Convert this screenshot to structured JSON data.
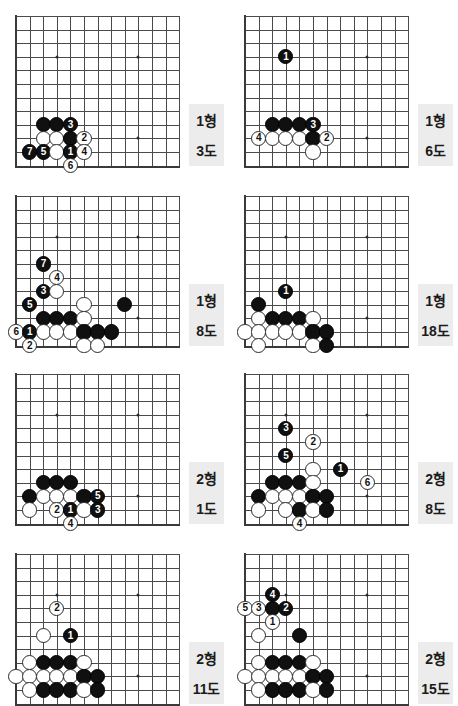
{
  "page": {
    "width": 458,
    "height": 700,
    "background": "#ffffff",
    "colors": {
      "grid_line": "#4a4a4a",
      "board_edge": "#3a3a3a",
      "black_stone": "#101010",
      "white_stone": "#ffffff",
      "caption_background": "#ececec",
      "caption_text": "#1b1b1b"
    }
  },
  "legend": {
    "hyeong_suffix": "형",
    "do_suffix": "도",
    "black_move_color": "#ffffff",
    "white_move_color": "#101010"
  },
  "diagrams": [
    {
      "id": "diagram-1",
      "problem_label": "1형",
      "figure_label": "3도",
      "cols": 12,
      "rows": 11,
      "stars": [
        [
          3,
          3
        ],
        [
          9,
          3
        ],
        [
          9,
          9
        ]
      ],
      "stones": [
        {
          "color": "black",
          "col": 2,
          "row": 8,
          "num": ""
        },
        {
          "color": "black",
          "col": 3,
          "row": 8,
          "num": ""
        },
        {
          "color": "black",
          "col": 4,
          "row": 8,
          "num": "3"
        },
        {
          "color": "white",
          "col": 2,
          "row": 9,
          "num": ""
        },
        {
          "color": "white",
          "col": 3,
          "row": 9,
          "num": ""
        },
        {
          "color": "black",
          "col": 4,
          "row": 9,
          "num": ""
        },
        {
          "color": "white",
          "col": 5,
          "row": 9,
          "num": "2"
        },
        {
          "color": "black",
          "col": 1,
          "row": 10,
          "num": "7"
        },
        {
          "color": "black",
          "col": 2,
          "row": 10,
          "num": "5"
        },
        {
          "color": "white",
          "col": 3,
          "row": 10,
          "num": ""
        },
        {
          "color": "black",
          "col": 4,
          "row": 10,
          "num": "1"
        },
        {
          "color": "white",
          "col": 5,
          "row": 10,
          "num": "4"
        },
        {
          "color": "white",
          "col": 4,
          "row": 11,
          "num": "6"
        }
      ]
    },
    {
      "id": "diagram-2",
      "problem_label": "1형",
      "figure_label": "6도",
      "cols": 12,
      "rows": 11,
      "stars": [
        [
          3,
          3
        ],
        [
          9,
          3
        ],
        [
          9,
          9
        ]
      ],
      "stones": [
        {
          "color": "black",
          "col": 3,
          "row": 3,
          "num": "1"
        },
        {
          "color": "black",
          "col": 2,
          "row": 8,
          "num": ""
        },
        {
          "color": "black",
          "col": 3,
          "row": 8,
          "num": ""
        },
        {
          "color": "black",
          "col": 4,
          "row": 8,
          "num": ""
        },
        {
          "color": "black",
          "col": 5,
          "row": 8,
          "num": "3"
        },
        {
          "color": "white",
          "col": 1,
          "row": 9,
          "num": "4"
        },
        {
          "color": "white",
          "col": 2,
          "row": 9,
          "num": ""
        },
        {
          "color": "white",
          "col": 3,
          "row": 9,
          "num": ""
        },
        {
          "color": "white",
          "col": 4,
          "row": 9,
          "num": ""
        },
        {
          "color": "black",
          "col": 5,
          "row": 9,
          "num": ""
        },
        {
          "color": "white",
          "col": 6,
          "row": 9,
          "num": "2"
        },
        {
          "color": "white",
          "col": 5,
          "row": 10,
          "num": ""
        }
      ]
    },
    {
      "id": "diagram-3",
      "problem_label": "1형",
      "figure_label": "8도",
      "cols": 12,
      "rows": 11,
      "stars": [
        [
          3,
          3
        ],
        [
          9,
          3
        ],
        [
          9,
          9
        ]
      ],
      "stones": [
        {
          "color": "black",
          "col": 2,
          "row": 5,
          "num": "7"
        },
        {
          "color": "white",
          "col": 3,
          "row": 6,
          "num": "4"
        },
        {
          "color": "black",
          "col": 2,
          "row": 7,
          "num": "3"
        },
        {
          "color": "white",
          "col": 3,
          "row": 7,
          "num": ""
        },
        {
          "color": "black",
          "col": 1,
          "row": 8,
          "num": "5"
        },
        {
          "color": "white",
          "col": 5,
          "row": 8,
          "num": ""
        },
        {
          "color": "black",
          "col": 8,
          "row": 8,
          "num": ""
        },
        {
          "color": "black",
          "col": 2,
          "row": 9,
          "num": ""
        },
        {
          "color": "black",
          "col": 3,
          "row": 9,
          "num": ""
        },
        {
          "color": "black",
          "col": 4,
          "row": 9,
          "num": ""
        },
        {
          "color": "white",
          "col": 5,
          "row": 9,
          "num": ""
        },
        {
          "color": "white",
          "col": 0,
          "row": 10,
          "num": "6"
        },
        {
          "color": "black",
          "col": 1,
          "row": 10,
          "num": "1"
        },
        {
          "color": "white",
          "col": 2,
          "row": 10,
          "num": ""
        },
        {
          "color": "white",
          "col": 3,
          "row": 10,
          "num": ""
        },
        {
          "color": "white",
          "col": 4,
          "row": 10,
          "num": ""
        },
        {
          "color": "black",
          "col": 5,
          "row": 10,
          "num": ""
        },
        {
          "color": "black",
          "col": 6,
          "row": 10,
          "num": ""
        },
        {
          "color": "black",
          "col": 7,
          "row": 10,
          "num": ""
        },
        {
          "color": "white",
          "col": 1,
          "row": 11,
          "num": "2"
        },
        {
          "color": "white",
          "col": 5,
          "row": 11,
          "num": ""
        },
        {
          "color": "white",
          "col": 6,
          "row": 11,
          "num": ""
        }
      ]
    },
    {
      "id": "diagram-4",
      "problem_label": "1형",
      "figure_label": "18도",
      "cols": 12,
      "rows": 11,
      "stars": [
        [
          3,
          3
        ],
        [
          9,
          3
        ],
        [
          9,
          9
        ]
      ],
      "stones": [
        {
          "color": "black",
          "col": 3,
          "row": 7,
          "num": "1"
        },
        {
          "color": "black",
          "col": 1,
          "row": 8,
          "num": ""
        },
        {
          "color": "white",
          "col": 1,
          "row": 9,
          "num": ""
        },
        {
          "color": "black",
          "col": 2,
          "row": 9,
          "num": ""
        },
        {
          "color": "black",
          "col": 3,
          "row": 9,
          "num": ""
        },
        {
          "color": "black",
          "col": 4,
          "row": 9,
          "num": ""
        },
        {
          "color": "white",
          "col": 5,
          "row": 9,
          "num": ""
        },
        {
          "color": "white",
          "col": 0,
          "row": 10,
          "num": ""
        },
        {
          "color": "white",
          "col": 1,
          "row": 10,
          "num": ""
        },
        {
          "color": "white",
          "col": 2,
          "row": 10,
          "num": ""
        },
        {
          "color": "white",
          "col": 3,
          "row": 10,
          "num": ""
        },
        {
          "color": "white",
          "col": 4,
          "row": 10,
          "num": ""
        },
        {
          "color": "black",
          "col": 5,
          "row": 10,
          "num": ""
        },
        {
          "color": "black",
          "col": 6,
          "row": 10,
          "num": ""
        },
        {
          "color": "white",
          "col": 1,
          "row": 11,
          "num": ""
        },
        {
          "color": "white",
          "col": 5,
          "row": 11,
          "num": ""
        },
        {
          "color": "black",
          "col": 6,
          "row": 11,
          "num": ""
        }
      ]
    },
    {
      "id": "diagram-5",
      "problem_label": "2형",
      "figure_label": "1도",
      "cols": 12,
      "rows": 11,
      "stars": [
        [
          3,
          3
        ],
        [
          9,
          3
        ],
        [
          9,
          9
        ]
      ],
      "stones": [
        {
          "color": "black",
          "col": 2,
          "row": 8,
          "num": ""
        },
        {
          "color": "black",
          "col": 3,
          "row": 8,
          "num": ""
        },
        {
          "color": "black",
          "col": 4,
          "row": 8,
          "num": ""
        },
        {
          "color": "black",
          "col": 1,
          "row": 9,
          "num": ""
        },
        {
          "color": "white",
          "col": 2,
          "row": 9,
          "num": ""
        },
        {
          "color": "white",
          "col": 3,
          "row": 9,
          "num": ""
        },
        {
          "color": "white",
          "col": 4,
          "row": 9,
          "num": ""
        },
        {
          "color": "black",
          "col": 5,
          "row": 9,
          "num": ""
        },
        {
          "color": "black",
          "col": 6,
          "row": 9,
          "num": "5"
        },
        {
          "color": "white",
          "col": 1,
          "row": 10,
          "num": ""
        },
        {
          "color": "white",
          "col": 3,
          "row": 10,
          "num": "2"
        },
        {
          "color": "black",
          "col": 4,
          "row": 10,
          "num": "1"
        },
        {
          "color": "white",
          "col": 5,
          "row": 10,
          "num": ""
        },
        {
          "color": "black",
          "col": 6,
          "row": 10,
          "num": "3"
        },
        {
          "color": "white",
          "col": 4,
          "row": 11,
          "num": "4"
        }
      ]
    },
    {
      "id": "diagram-6",
      "problem_label": "2형",
      "figure_label": "8도",
      "cols": 12,
      "rows": 11,
      "stars": [
        [
          3,
          3
        ],
        [
          9,
          3
        ],
        [
          9,
          9
        ]
      ],
      "stones": [
        {
          "color": "black",
          "col": 3,
          "row": 4,
          "num": "3"
        },
        {
          "color": "white",
          "col": 5,
          "row": 5,
          "num": "2"
        },
        {
          "color": "black",
          "col": 3,
          "row": 6,
          "num": "5"
        },
        {
          "color": "white",
          "col": 5,
          "row": 7,
          "num": ""
        },
        {
          "color": "black",
          "col": 7,
          "row": 7,
          "num": "1"
        },
        {
          "color": "black",
          "col": 2,
          "row": 8,
          "num": ""
        },
        {
          "color": "black",
          "col": 3,
          "row": 8,
          "num": ""
        },
        {
          "color": "black",
          "col": 4,
          "row": 8,
          "num": ""
        },
        {
          "color": "white",
          "col": 5,
          "row": 8,
          "num": ""
        },
        {
          "color": "white",
          "col": 9,
          "row": 8,
          "num": "6"
        },
        {
          "color": "black",
          "col": 1,
          "row": 9,
          "num": ""
        },
        {
          "color": "white",
          "col": 2,
          "row": 9,
          "num": ""
        },
        {
          "color": "white",
          "col": 3,
          "row": 9,
          "num": ""
        },
        {
          "color": "white",
          "col": 4,
          "row": 9,
          "num": ""
        },
        {
          "color": "black",
          "col": 5,
          "row": 9,
          "num": ""
        },
        {
          "color": "black",
          "col": 6,
          "row": 9,
          "num": ""
        },
        {
          "color": "white",
          "col": 1,
          "row": 10,
          "num": ""
        },
        {
          "color": "white",
          "col": 3,
          "row": 10,
          "num": ""
        },
        {
          "color": "black",
          "col": 4,
          "row": 10,
          "num": ""
        },
        {
          "color": "white",
          "col": 5,
          "row": 10,
          "num": ""
        },
        {
          "color": "black",
          "col": 6,
          "row": 10,
          "num": ""
        },
        {
          "color": "white",
          "col": 4,
          "row": 11,
          "num": "4"
        }
      ]
    },
    {
      "id": "diagram-7",
      "problem_label": "2형",
      "figure_label": "11도",
      "cols": 12,
      "rows": 11,
      "stars": [
        [
          3,
          3
        ],
        [
          9,
          3
        ],
        [
          9,
          9
        ]
      ],
      "stones": [
        {
          "color": "white",
          "col": 3,
          "row": 4,
          "num": "2"
        },
        {
          "color": "white",
          "col": 2,
          "row": 6,
          "num": ""
        },
        {
          "color": "black",
          "col": 4,
          "row": 6,
          "num": "1"
        },
        {
          "color": "white",
          "col": 1,
          "row": 8,
          "num": ""
        },
        {
          "color": "black",
          "col": 2,
          "row": 8,
          "num": ""
        },
        {
          "color": "black",
          "col": 3,
          "row": 8,
          "num": ""
        },
        {
          "color": "black",
          "col": 4,
          "row": 8,
          "num": ""
        },
        {
          "color": "white",
          "col": 5,
          "row": 8,
          "num": ""
        },
        {
          "color": "white",
          "col": 0,
          "row": 9,
          "num": ""
        },
        {
          "color": "white",
          "col": 1,
          "row": 9,
          "num": ""
        },
        {
          "color": "white",
          "col": 2,
          "row": 9,
          "num": ""
        },
        {
          "color": "white",
          "col": 3,
          "row": 9,
          "num": ""
        },
        {
          "color": "white",
          "col": 4,
          "row": 9,
          "num": ""
        },
        {
          "color": "black",
          "col": 5,
          "row": 9,
          "num": ""
        },
        {
          "color": "black",
          "col": 6,
          "row": 9,
          "num": ""
        },
        {
          "color": "white",
          "col": 1,
          "row": 10,
          "num": ""
        },
        {
          "color": "black",
          "col": 2,
          "row": 10,
          "num": ""
        },
        {
          "color": "black",
          "col": 3,
          "row": 10,
          "num": ""
        },
        {
          "color": "black",
          "col": 4,
          "row": 10,
          "num": ""
        },
        {
          "color": "white",
          "col": 5,
          "row": 10,
          "num": ""
        },
        {
          "color": "black",
          "col": 6,
          "row": 10,
          "num": ""
        }
      ]
    },
    {
      "id": "diagram-8",
      "problem_label": "2형",
      "figure_label": "15도",
      "cols": 12,
      "rows": 11,
      "stars": [
        [
          3,
          3
        ],
        [
          9,
          3
        ],
        [
          9,
          9
        ]
      ],
      "stones": [
        {
          "color": "black",
          "col": 2,
          "row": 3,
          "num": "4"
        },
        {
          "color": "white",
          "col": 0,
          "row": 4,
          "num": "5"
        },
        {
          "color": "white",
          "col": 1,
          "row": 4,
          "num": "3"
        },
        {
          "color": "black",
          "col": 2,
          "row": 4,
          "num": ""
        },
        {
          "color": "black",
          "col": 3,
          "row": 4,
          "num": "2"
        },
        {
          "color": "white",
          "col": 2,
          "row": 5,
          "num": "1"
        },
        {
          "color": "white",
          "col": 1,
          "row": 6,
          "num": ""
        },
        {
          "color": "black",
          "col": 4,
          "row": 6,
          "num": ""
        },
        {
          "color": "white",
          "col": 1,
          "row": 8,
          "num": ""
        },
        {
          "color": "black",
          "col": 2,
          "row": 8,
          "num": ""
        },
        {
          "color": "black",
          "col": 3,
          "row": 8,
          "num": ""
        },
        {
          "color": "black",
          "col": 4,
          "row": 8,
          "num": ""
        },
        {
          "color": "white",
          "col": 5,
          "row": 8,
          "num": ""
        },
        {
          "color": "white",
          "col": 0,
          "row": 9,
          "num": ""
        },
        {
          "color": "white",
          "col": 1,
          "row": 9,
          "num": ""
        },
        {
          "color": "white",
          "col": 2,
          "row": 9,
          "num": ""
        },
        {
          "color": "white",
          "col": 3,
          "row": 9,
          "num": ""
        },
        {
          "color": "white",
          "col": 4,
          "row": 9,
          "num": ""
        },
        {
          "color": "black",
          "col": 5,
          "row": 9,
          "num": ""
        },
        {
          "color": "black",
          "col": 6,
          "row": 9,
          "num": ""
        },
        {
          "color": "white",
          "col": 1,
          "row": 10,
          "num": ""
        },
        {
          "color": "black",
          "col": 2,
          "row": 10,
          "num": ""
        },
        {
          "color": "black",
          "col": 3,
          "row": 10,
          "num": ""
        },
        {
          "color": "black",
          "col": 4,
          "row": 10,
          "num": ""
        },
        {
          "color": "white",
          "col": 5,
          "row": 10,
          "num": ""
        },
        {
          "color": "black",
          "col": 6,
          "row": 10,
          "num": ""
        }
      ]
    }
  ]
}
